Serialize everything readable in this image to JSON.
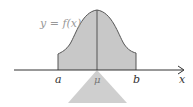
{
  "diagram": {
    "curve_label": "y = f(x)",
    "labels": {
      "a": "a",
      "mu": "μ",
      "b": "b",
      "x": "x"
    },
    "colors": {
      "fill": "#c8c8c8",
      "stroke": "#555555",
      "axis": "#333333",
      "curve_label": "#999999",
      "fulcrum": "#cfcfcf"
    }
  }
}
